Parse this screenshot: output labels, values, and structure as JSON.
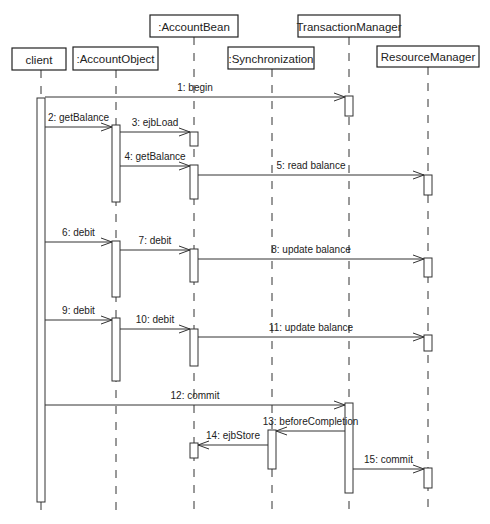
{
  "diagram": {
    "type": "UML sequence diagram",
    "participants": [
      {
        "id": "client",
        "label": "client",
        "box": [
          12,
          48,
          54,
          22
        ],
        "x": 41
      },
      {
        "id": "account-object",
        "label": ":AccountObject",
        "box": [
          73,
          47,
          85,
          23
        ],
        "x": 116
      },
      {
        "id": "account-bean",
        "label": ":AccountBean",
        "box": [
          150,
          15,
          88,
          22
        ],
        "x": 194
      },
      {
        "id": "synchronization",
        "label": ":Synchronization",
        "box": [
          228,
          47,
          86,
          22
        ],
        "x": 272
      },
      {
        "id": "transaction-manager",
        "label": "TransactionManager",
        "box": [
          298,
          15,
          102,
          22
        ],
        "x": 349
      },
      {
        "id": "resource-manager",
        "label": "ResourceManager",
        "box": [
          377,
          46,
          102,
          21
        ],
        "x": 428
      }
    ],
    "lifeline_end_y": 515,
    "activations": [
      {
        "on": "client",
        "y1": 98,
        "y2": 502
      },
      {
        "on": "transaction-manager",
        "y1": 96,
        "y2": 116
      },
      {
        "on": "account-object",
        "y1": 125,
        "y2": 202
      },
      {
        "on": "account-bean",
        "y1": 132,
        "y2": 146
      },
      {
        "on": "account-bean",
        "y1": 165,
        "y2": 199
      },
      {
        "on": "resource-manager",
        "y1": 175,
        "y2": 195
      },
      {
        "on": "account-object",
        "y1": 241,
        "y2": 297
      },
      {
        "on": "account-bean",
        "y1": 249,
        "y2": 282
      },
      {
        "on": "resource-manager",
        "y1": 258,
        "y2": 277
      },
      {
        "on": "account-object",
        "y1": 318,
        "y2": 381
      },
      {
        "on": "account-bean",
        "y1": 329,
        "y2": 366
      },
      {
        "on": "resource-manager",
        "y1": 335,
        "y2": 351
      },
      {
        "on": "transaction-manager",
        "y1": 403,
        "y2": 493
      },
      {
        "on": "synchronization",
        "y1": 430,
        "y2": 469
      },
      {
        "on": "account-bean",
        "y1": 443,
        "y2": 458
      },
      {
        "on": "resource-manager",
        "y1": 468,
        "y2": 488
      }
    ],
    "messages": [
      {
        "label": "1: begin",
        "from": "client",
        "to": "transaction-manager",
        "y": 97
      },
      {
        "label": "2: getBalance",
        "from": "client",
        "to": "account-object",
        "y": 127
      },
      {
        "label": "3: ejbLoad",
        "from": "account-object",
        "to": "account-bean",
        "y": 132
      },
      {
        "label": "4: getBalance",
        "from": "account-object",
        "to": "account-bean",
        "y": 166
      },
      {
        "label": "5: read balance",
        "from": "account-bean",
        "to": "resource-manager",
        "y": 175
      },
      {
        "label": "6: debit",
        "from": "client",
        "to": "account-object",
        "y": 242
      },
      {
        "label": "7: debit",
        "from": "account-object",
        "to": "account-bean",
        "y": 250
      },
      {
        "label": "8: update balance",
        "from": "account-bean",
        "to": "resource-manager",
        "y": 259
      },
      {
        "label": "9: debit",
        "from": "client",
        "to": "account-object",
        "y": 320
      },
      {
        "label": "10: debit",
        "from": "account-object",
        "to": "account-bean",
        "y": 329
      },
      {
        "label": "11: update balance",
        "from": "account-bean",
        "to": "resource-manager",
        "y": 337
      },
      {
        "label": "12: commit",
        "from": "client",
        "to": "transaction-manager",
        "y": 405
      },
      {
        "label": "13: beforeCompletion",
        "from": "transaction-manager",
        "to": "synchronization",
        "y": 431
      },
      {
        "label": "14: ejbStore",
        "from": "synchronization",
        "to": "account-bean",
        "y": 445
      },
      {
        "label": "15: commit",
        "from": "transaction-manager",
        "to": "resource-manager",
        "y": 469
      }
    ]
  }
}
